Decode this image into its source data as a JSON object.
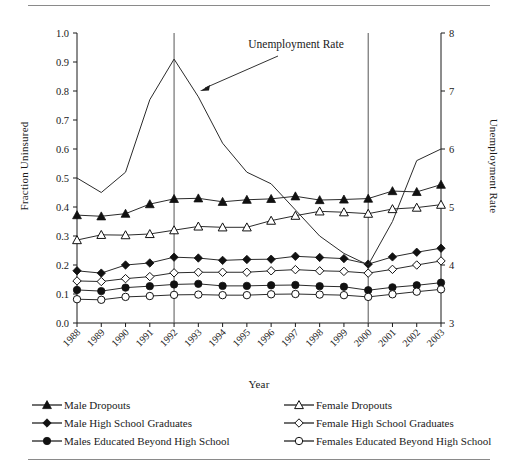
{
  "chart_data": {
    "type": "line",
    "title": "",
    "xlabel": "Year",
    "ylabel": "Fraction Uninsured",
    "ylabel_right": "Unemployment Rate",
    "categories": [
      "1988",
      "1989",
      "1990",
      "1991",
      "1992",
      "1993",
      "1994",
      "1995",
      "1996",
      "1997",
      "1998",
      "1999",
      "2000",
      "2001",
      "2002",
      "2003"
    ],
    "ylim": [
      0.0,
      1.0
    ],
    "yticks": [
      "0.0",
      "0.1",
      "0.2",
      "0.3",
      "0.4",
      "0.5",
      "0.6",
      "0.7",
      "0.8",
      "0.9",
      "1.0"
    ],
    "ylim_right": [
      3,
      8
    ],
    "yticks_right": [
      "3",
      "4",
      "5",
      "6",
      "7",
      "8"
    ],
    "grid": false,
    "legend_position": "below",
    "annotations": [
      {
        "text": "Unemployment Rate",
        "points_to": "1993 peak of unemployment line"
      }
    ],
    "reference_lines": [
      {
        "x": "1992",
        "orientation": "vertical"
      },
      {
        "x": "2000",
        "orientation": "vertical"
      }
    ],
    "series": [
      {
        "name": "Male Dropouts",
        "axis": "left",
        "marker": "filled-triangle",
        "values": [
          0.372,
          0.368,
          0.377,
          0.41,
          0.428,
          0.43,
          0.418,
          0.425,
          0.428,
          0.437,
          0.424,
          0.426,
          0.429,
          0.455,
          0.452,
          0.477
        ]
      },
      {
        "name": "Female Dropouts",
        "axis": "left",
        "marker": "open-triangle",
        "values": [
          0.286,
          0.304,
          0.303,
          0.307,
          0.32,
          0.333,
          0.33,
          0.33,
          0.353,
          0.37,
          0.385,
          0.382,
          0.377,
          0.393,
          0.398,
          0.408
        ]
      },
      {
        "name": "Male High School Graduates",
        "axis": "left",
        "marker": "filled-diamond",
        "values": [
          0.18,
          0.172,
          0.2,
          0.207,
          0.227,
          0.224,
          0.216,
          0.219,
          0.22,
          0.23,
          0.226,
          0.222,
          0.203,
          0.228,
          0.244,
          0.258
        ]
      },
      {
        "name": "Female High School Graduates",
        "axis": "left",
        "marker": "open-diamond",
        "values": [
          0.145,
          0.143,
          0.153,
          0.16,
          0.173,
          0.175,
          0.175,
          0.175,
          0.18,
          0.184,
          0.18,
          0.178,
          0.172,
          0.185,
          0.2,
          0.214
        ]
      },
      {
        "name": "Males Educated Beyond High School",
        "axis": "left",
        "marker": "filled-circle",
        "values": [
          0.114,
          0.11,
          0.122,
          0.127,
          0.133,
          0.135,
          0.128,
          0.128,
          0.13,
          0.131,
          0.127,
          0.125,
          0.113,
          0.123,
          0.13,
          0.139
        ]
      },
      {
        "name": "Females Educated Beyond High School",
        "axis": "left",
        "marker": "open-circle",
        "values": [
          0.082,
          0.08,
          0.09,
          0.093,
          0.097,
          0.098,
          0.096,
          0.096,
          0.099,
          0.1,
          0.098,
          0.096,
          0.09,
          0.099,
          0.108,
          0.116
        ]
      },
      {
        "name": "Unemployment Rate",
        "axis": "right",
        "marker": "none",
        "values": [
          5.5,
          5.25,
          5.6,
          6.85,
          7.55,
          6.9,
          6.1,
          5.6,
          5.4,
          4.95,
          4.5,
          4.2,
          4.0,
          4.75,
          5.8,
          6.0
        ]
      }
    ]
  },
  "legend": {
    "items_left": [
      {
        "label": "Male Dropouts",
        "marker": "filled-triangle"
      },
      {
        "label": "Male High School Graduates",
        "marker": "filled-diamond"
      },
      {
        "label": "Males Educated Beyond High School",
        "marker": "filled-circle"
      }
    ],
    "items_right": [
      {
        "label": "Female Dropouts",
        "marker": "open-triangle"
      },
      {
        "label": "Female High School Graduates",
        "marker": "open-diamond"
      },
      {
        "label": "Females Educated Beyond High School",
        "marker": "open-circle"
      }
    ]
  },
  "colors": {
    "ink": "#1a1a1a",
    "line": "#2b2b2b",
    "rule": "#8a8a8a",
    "reference_line": "#555555",
    "background": "#ffffff"
  }
}
